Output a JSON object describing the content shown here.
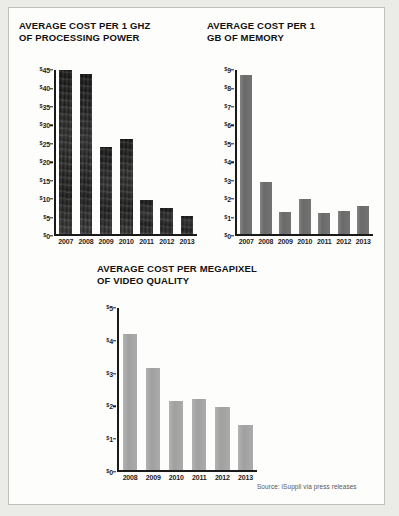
{
  "source_note": "Source: iSuppli via press releases",
  "chart_data": [
    {
      "type": "bar",
      "title": "AVERAGE COST PER 1 GHZ\nOF PROCESSING POWER",
      "xlabel": "",
      "ylabel": "",
      "ylim": [
        0,
        45
      ],
      "yticks": [
        0,
        5,
        10,
        15,
        20,
        25,
        30,
        35,
        40,
        45
      ],
      "ytick_labels": [
        "$0",
        "$5",
        "$10",
        "$15",
        "$20",
        "$25",
        "$30",
        "$35",
        "$40",
        "$45"
      ],
      "categories": [
        "2007",
        "2008",
        "2009",
        "2010",
        "2011",
        "2012",
        "2013"
      ],
      "values": [
        44.9,
        43.9,
        24.0,
        26.0,
        9.3,
        7.3,
        5.1
      ],
      "grid": false,
      "legend": "none",
      "bar_color": "#161616"
    },
    {
      "type": "bar",
      "title": "AVERAGE COST PER 1\nGB OF MEMORY",
      "xlabel": "",
      "ylabel": "",
      "ylim": [
        0,
        9
      ],
      "yticks": [
        0,
        1,
        2,
        3,
        4,
        5,
        6,
        7,
        8,
        9
      ],
      "ytick_labels": [
        "$0",
        "$1",
        "$2",
        "$3",
        "$4",
        "$5",
        "$6",
        "$7",
        "$8",
        "$9"
      ],
      "categories": [
        "2007",
        "2008",
        "2009",
        "2010",
        "2011",
        "2012",
        "2013"
      ],
      "values": [
        8.7,
        2.85,
        1.25,
        1.95,
        1.2,
        1.3,
        1.55
      ],
      "grid": false,
      "legend": "none",
      "bar_color": "#6f6f6f"
    },
    {
      "type": "bar",
      "title": "AVERAGE COST PER MEGAPIXEL\nOF VIDEO QUALITY",
      "xlabel": "",
      "ylabel": "",
      "ylim": [
        0,
        5
      ],
      "yticks": [
        0,
        1,
        2,
        3,
        4,
        5
      ],
      "ytick_labels": [
        "$0",
        "$1",
        "$2",
        "$3",
        "$4",
        "$5"
      ],
      "categories": [
        "2008",
        "2009",
        "2010",
        "2011",
        "2012",
        "2013"
      ],
      "values": [
        4.2,
        3.15,
        2.15,
        2.2,
        1.95,
        1.4
      ],
      "grid": false,
      "legend": "none",
      "bar_color": "#a6a6a6"
    }
  ]
}
